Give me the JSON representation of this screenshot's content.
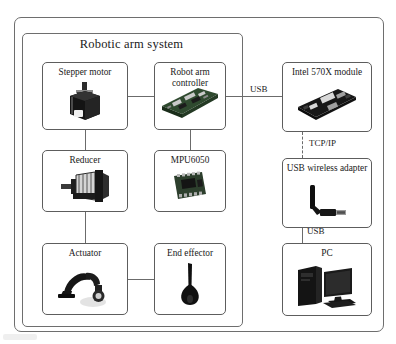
{
  "diagram": {
    "title": "Robotic arm system",
    "type": "system-block-diagram",
    "blocks": [
      {
        "id": "stepper-motor",
        "label": "Stepper motor",
        "icon": "stepper-motor-icon",
        "column": "left",
        "row": 1
      },
      {
        "id": "reducer",
        "label": "Reducer",
        "icon": "reducer-gearbox-icon",
        "column": "left",
        "row": 2
      },
      {
        "id": "actuator",
        "label": "Actuator",
        "icon": "robot-arm-icon",
        "column": "left",
        "row": 3
      },
      {
        "id": "robot-arm-controller",
        "label": "Robot arm controller",
        "icon": "controller-board-icon",
        "column": "middle",
        "row": 1
      },
      {
        "id": "mpu6050",
        "label": "MPU6050",
        "icon": "imu-chip-icon",
        "column": "middle",
        "row": 2
      },
      {
        "id": "end-effector",
        "label": "End effector",
        "icon": "end-effector-icon",
        "column": "middle",
        "row": 3
      },
      {
        "id": "intel-570x-module",
        "label": "Intel 570X module",
        "icon": "intel-board-icon",
        "column": "right",
        "row": 1
      },
      {
        "id": "usb-wireless-adapter",
        "label": "USB wireless adapter",
        "icon": "wifi-dongle-icon",
        "column": "right",
        "row": 2
      },
      {
        "id": "pc",
        "label": "PC",
        "icon": "desktop-computer-icon",
        "column": "right",
        "row": 3
      }
    ],
    "connections": [
      {
        "id": "stepper-to-controller",
        "from": "stepper-motor",
        "to": "robot-arm-controller",
        "label": "",
        "style": "solid"
      },
      {
        "id": "stepper-to-reducer",
        "from": "stepper-motor",
        "to": "reducer",
        "label": "",
        "style": "solid"
      },
      {
        "id": "reducer-to-actuator",
        "from": "reducer",
        "to": "actuator",
        "label": "",
        "style": "solid"
      },
      {
        "id": "controller-to-mpu",
        "from": "robot-arm-controller",
        "to": "mpu6050",
        "label": "",
        "style": "solid"
      },
      {
        "id": "actuator-to-endeff",
        "from": "actuator",
        "to": "end-effector",
        "label": "",
        "style": "solid"
      },
      {
        "id": "controller-to-intel",
        "from": "robot-arm-controller",
        "to": "intel-570x-module",
        "label": "USB",
        "style": "solid"
      },
      {
        "id": "intel-to-adapter",
        "from": "intel-570x-module",
        "to": "usb-wireless-adapter",
        "label": "TCP/IP",
        "style": "dashed"
      },
      {
        "id": "adapter-to-pc",
        "from": "usb-wireless-adapter",
        "to": "pc",
        "label": "USB",
        "style": "solid"
      }
    ],
    "labels": {
      "usb_top": "USB",
      "tcpip": "TCP/IP",
      "usb_bottom": "USB"
    },
    "colors": {
      "frame_stroke": "#6e6e6e",
      "box_stroke": "#5d5d5d",
      "connector": "#6b6b6b",
      "text": "#1a1a1a",
      "background": "#ffffff"
    }
  }
}
